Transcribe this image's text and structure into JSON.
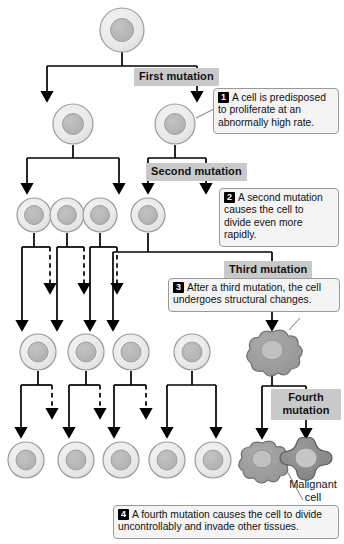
{
  "diagram": {
    "colors": {
      "cytoplasm": "#e9e9e9",
      "cytoplasm_edge": "#9b9b9b",
      "nucleus": "#b4b4b4",
      "nucleus_edge": "#9a9a9a",
      "malignant_body": "#8d8d8d",
      "malignant_edge": "#5c5c5c",
      "transitional_body": "#9e9e9e",
      "label_bg": "#c9c9c9",
      "callout_bg": "#f4f4f4",
      "arrow": "#000000"
    }
  },
  "stage_labels": [
    {
      "id": "first",
      "text": "First mutation"
    },
    {
      "id": "second",
      "text": "Second mutation"
    },
    {
      "id": "third",
      "text": "Third mutation"
    },
    {
      "id": "fourth",
      "text": "Fourth\nmutation"
    }
  ],
  "callouts": [
    {
      "num": "1",
      "text": "A cell is predisposed to proliferate at an abnormally high rate."
    },
    {
      "num": "2",
      "text": "A second mutation causes the cell to divide even more rapidly."
    },
    {
      "num": "3",
      "text": "After a third mutation, the cell undergoes structural changes."
    },
    {
      "num": "4",
      "text": "A fourth mutation causes the cell to divide uncontrollably and invade other tissues."
    }
  ],
  "annotations": [
    {
      "id": "malignant-cell",
      "text": "Malignant\ncell"
    }
  ],
  "cells": {
    "row1": [
      {
        "id": "cell-origin",
        "type": "normal",
        "cx": 122,
        "cy": 30,
        "r": 22
      }
    ],
    "row2": [
      {
        "id": "cell-r2-1",
        "type": "normal",
        "cx": 73,
        "cy": 124,
        "r": 20
      },
      {
        "id": "cell-r2-2",
        "type": "normal",
        "cx": 175,
        "cy": 124,
        "r": 20
      }
    ],
    "row3": [
      {
        "id": "cell-r3-1",
        "type": "normal",
        "cx": 34,
        "cy": 215,
        "r": 17
      },
      {
        "id": "cell-r3-2",
        "type": "normal",
        "cx": 67,
        "cy": 215,
        "r": 17
      },
      {
        "id": "cell-r3-3",
        "type": "normal",
        "cx": 100,
        "cy": 215,
        "r": 17
      },
      {
        "id": "cell-r3-4",
        "type": "normal",
        "cx": 148,
        "cy": 215,
        "r": 17
      }
    ],
    "row4": [
      {
        "id": "cell-r4-1",
        "type": "normal",
        "cx": 38,
        "cy": 352,
        "r": 18
      },
      {
        "id": "cell-r4-2",
        "type": "normal",
        "cx": 86,
        "cy": 352,
        "r": 18
      },
      {
        "id": "cell-r4-3",
        "type": "normal",
        "cx": 131,
        "cy": 352,
        "r": 18
      },
      {
        "id": "cell-r4-4",
        "type": "normal",
        "cx": 192,
        "cy": 352,
        "r": 18
      },
      {
        "id": "cell-r4-5",
        "type": "transitional",
        "cx": 272,
        "cy": 352,
        "r": 19
      }
    ],
    "row5": [
      {
        "id": "cell-r5-1",
        "type": "normal",
        "cx": 26,
        "cy": 460,
        "r": 18
      },
      {
        "id": "cell-r5-2",
        "type": "normal",
        "cx": 76,
        "cy": 460,
        "r": 18
      },
      {
        "id": "cell-r5-3",
        "type": "normal",
        "cx": 121,
        "cy": 460,
        "r": 18
      },
      {
        "id": "cell-r5-4",
        "type": "normal",
        "cx": 167,
        "cy": 460,
        "r": 18
      },
      {
        "id": "cell-r5-5",
        "type": "normal",
        "cx": 213,
        "cy": 460,
        "r": 18
      },
      {
        "id": "cell-r5-6",
        "type": "transitional",
        "cx": 262,
        "cy": 461,
        "r": 18
      },
      {
        "id": "cell-r5-7",
        "type": "malignant",
        "cx": 306,
        "cy": 460,
        "r": 21
      }
    ]
  }
}
